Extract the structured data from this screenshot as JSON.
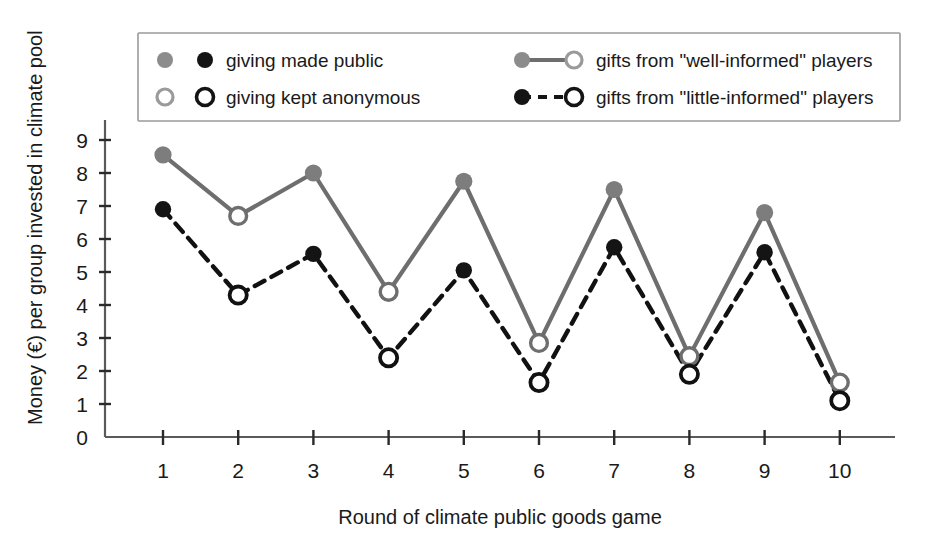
{
  "chart_data": {
    "type": "line",
    "title": "",
    "xlabel": "Round of climate public goods game",
    "ylabel": "Money (€) per group invested in climate pool",
    "x": [
      1,
      2,
      3,
      4,
      5,
      6,
      7,
      8,
      9,
      10
    ],
    "xtick_labels": [
      "1",
      "2",
      "3",
      "4",
      "5",
      "6",
      "7",
      "8",
      "9",
      "10"
    ],
    "ytick_labels": [
      "0",
      "1",
      "2",
      "3",
      "4",
      "5",
      "6",
      "7",
      "8",
      "9"
    ],
    "ylim": [
      0,
      9.8
    ],
    "xlim": [
      0.55,
      10.45
    ],
    "grid": false,
    "legend_position": "top-center-inside",
    "marker_rule": "odd rounds = filled (giving made public); even rounds = open (giving kept anonymous)",
    "series": [
      {
        "name": "gifts from \"well-informed\" players",
        "color": "#6e6e6e",
        "line_style": "solid",
        "values": [
          8.55,
          6.7,
          8.0,
          4.4,
          7.75,
          2.85,
          7.5,
          2.45,
          6.8,
          1.65
        ],
        "marker_fill": [
          "filled",
          "open",
          "filled",
          "open",
          "filled",
          "open",
          "filled",
          "open",
          "filled",
          "open"
        ]
      },
      {
        "name": "gifts from \"little-informed\" players",
        "color": "#111111",
        "line_style": "dashed",
        "values": [
          6.9,
          4.3,
          5.55,
          2.4,
          5.05,
          1.65,
          5.75,
          1.9,
          5.6,
          1.1
        ],
        "marker_fill": [
          "filled",
          "open",
          "filled",
          "open",
          "filled",
          "open",
          "filled",
          "open",
          "filled",
          "open"
        ]
      }
    ]
  },
  "legend": {
    "entries": [
      {
        "id": "giving-made-public",
        "label": "giving made public",
        "swatch": "gray-filled-circle + black-filled-circle"
      },
      {
        "id": "giving-kept-anonymous",
        "label": "giving kept anonymous",
        "swatch": "gray-open-circle + black-open-circle"
      },
      {
        "id": "well-informed",
        "label": "gifts from \"well-informed\" players",
        "swatch": "gray-solid-line-filled-to-open"
      },
      {
        "id": "little-informed",
        "label": "gifts from \"little-informed\" players",
        "swatch": "black-dashed-line-filled-to-open"
      }
    ]
  },
  "colors": {
    "well_informed": "#6e6e6e",
    "little_informed": "#111111",
    "axis": "#5a5a5a",
    "text": "#1a1a1a",
    "background": "#ffffff",
    "legend_border": "#9a9a9a"
  }
}
